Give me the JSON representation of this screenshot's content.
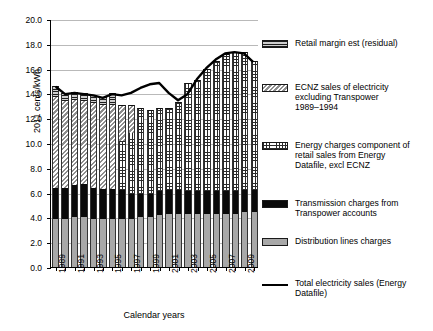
{
  "chart_data": {
    "type": "bar",
    "subtype": "stacked-bar-with-line",
    "title": "",
    "xlabel": "Calendar years",
    "ylabel": "2011 cents/kWh",
    "ylim": [
      0.0,
      20.0
    ],
    "ytick_step": 2.0,
    "ytick_labels": [
      "0.0",
      "2.0",
      "4.0",
      "6.0",
      "8.0",
      "10.0",
      "12.0",
      "14.0",
      "16.0",
      "18.0",
      "20.0"
    ],
    "grid": "horizontal",
    "legend_position": "right",
    "categories": [
      1989,
      1990,
      1991,
      1992,
      1993,
      1994,
      1995,
      1996,
      1997,
      1998,
      1999,
      2000,
      2001,
      2002,
      2003,
      2004,
      2005,
      2006,
      2007,
      2008,
      2009,
      2010
    ],
    "xtick_labels": [
      "1989",
      "1991",
      "1993",
      "1995",
      "1997",
      "1999",
      "2001",
      "2003",
      "2005",
      "2007",
      "2009"
    ],
    "series": [
      {
        "name": "Distribution lines charges",
        "pattern": "solid-grey",
        "color": "#a8a8a8",
        "values": [
          3.9,
          3.9,
          4.0,
          4.0,
          3.9,
          3.9,
          3.9,
          3.9,
          3.9,
          4.0,
          4.0,
          4.2,
          4.3,
          4.3,
          4.3,
          4.3,
          4.3,
          4.3,
          4.3,
          4.3,
          4.4,
          4.4
        ]
      },
      {
        "name": "Transmission charges from Transpower accounts",
        "pattern": "solid-black",
        "color": "#0a0a0a",
        "values": [
          2.5,
          2.5,
          2.6,
          2.7,
          2.5,
          2.4,
          2.4,
          2.3,
          2.0,
          1.9,
          1.9,
          1.9,
          1.9,
          1.9,
          1.8,
          1.8,
          1.8,
          1.8,
          1.8,
          1.8,
          1.8,
          1.8
        ]
      },
      {
        "name": "Energy charges component of retail sales from Energy Datafile, excl ECNZ",
        "pattern": "cross-hatch-grid",
        "color": "#ffffff",
        "values": [
          0,
          0,
          0,
          0,
          0,
          0,
          0,
          4.0,
          4.9,
          6.9,
          6.8,
          6.7,
          6.6,
          7.1,
          8.7,
          9.0,
          9.9,
          10.5,
          11.1,
          11.2,
          11.1,
          10.4
        ]
      },
      {
        "name": "ECNZ sales of electricity excluding Transpower 1989-1994",
        "pattern": "diagonal-hatch",
        "color": "#d8d8d8",
        "values": [
          7.3,
          7.0,
          6.9,
          6.7,
          6.8,
          6.8,
          6.8,
          2.9,
          2.3,
          0,
          0,
          0,
          0,
          0,
          0,
          0,
          0,
          0,
          0,
          0,
          0,
          0
        ]
      },
      {
        "name": "Retail margin est (residual)",
        "pattern": "horizontal-stripe",
        "color": "#9a9a9a",
        "values": [
          0.9,
          0.6,
          0.6,
          0.6,
          0.7,
          0.6,
          0.9,
          0,
          0,
          0,
          0,
          0,
          0,
          0,
          0,
          0,
          0,
          0,
          0,
          0,
          0,
          0
        ]
      }
    ],
    "line_series": {
      "name": "Total electricity sales (Energy Datafile)",
      "color": "#000000",
      "values": [
        14.6,
        14.0,
        14.1,
        14.0,
        13.9,
        13.7,
        14.0,
        13.9,
        14.1,
        14.5,
        14.8,
        14.9,
        14.1,
        13.5,
        14.0,
        15.2,
        16.1,
        16.8,
        17.3,
        17.4,
        17.3,
        16.6
      ]
    }
  },
  "axis": {
    "ylabel": "2011 cents/kWh",
    "xlabel": "Calendar years"
  },
  "legend": {
    "items": [
      {
        "label": "Retail margin est (residual)",
        "swatch": "horizontal-stripe-swatch"
      },
      {
        "label": "ECNZ sales of electricity\nexcluding Transpower\n1989–1994",
        "swatch": "diagonal-hatch-swatch"
      },
      {
        "label": "Energy charges component of\nretail sales from Energy\nDatafile, excl ECNZ",
        "swatch": "cross-hatch-swatch"
      },
      {
        "label": "Transmission charges from\nTranspower accounts",
        "swatch": "solid-black-swatch"
      },
      {
        "label": "Distribution lines charges",
        "swatch": "solid-grey-swatch"
      },
      {
        "label": "Total electricity sales (Energy\nDatafile)",
        "swatch": "line-swatch"
      }
    ]
  }
}
